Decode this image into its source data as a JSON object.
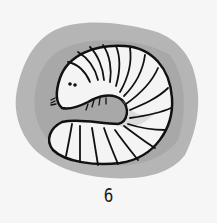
{
  "illustration": {
    "subject": "grub-larva",
    "colors": {
      "background": "#f6f6f6",
      "blob": "#a9a9a9",
      "body": "#f4f4f4",
      "shade": "#d0d0d0",
      "outline": "#111111"
    }
  },
  "caption": {
    "number": "6"
  }
}
